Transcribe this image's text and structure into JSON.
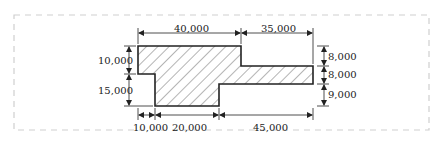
{
  "diagram": {
    "type": "dimensioned cross-section drawing",
    "frame": {
      "style": "dashed",
      "color": "#cfcfcf"
    },
    "shape": {
      "fill": "hatched",
      "outline_color": "#222222",
      "hatch_color": "#444444"
    },
    "dimensions": {
      "top": [
        {
          "label": "40,000"
        },
        {
          "label": "35,000"
        }
      ],
      "left": [
        {
          "label": "10,000"
        },
        {
          "label": "15,000"
        }
      ],
      "right": [
        {
          "label": "8,000"
        },
        {
          "label": "8,000"
        },
        {
          "label": "9,000"
        }
      ],
      "bottom": [
        {
          "label": "10,000"
        },
        {
          "label": "20,000"
        },
        {
          "label": "45,000"
        }
      ]
    }
  }
}
